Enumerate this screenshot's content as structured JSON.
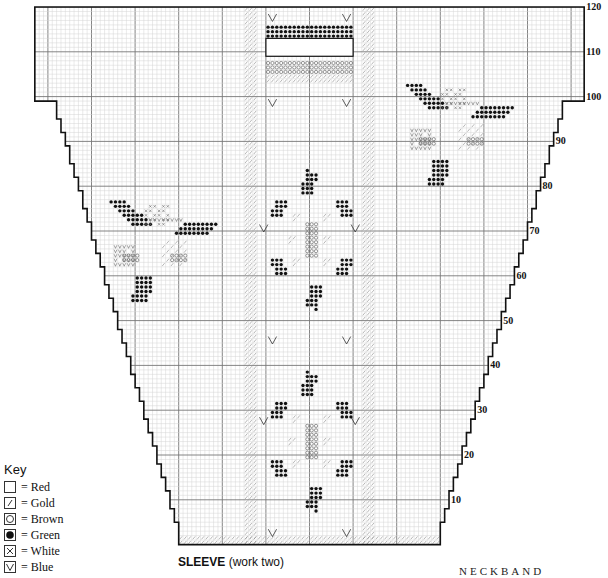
{
  "chart_data": {
    "type": "knitting-chart",
    "title": "SLEEVE",
    "subtitle": "(work two)",
    "secondary_label": "NECKBAND",
    "rows": 120,
    "row_labels": [
      "10",
      "20",
      "30",
      "40",
      "50",
      "60",
      "70",
      "80",
      "90",
      "100",
      "110",
      "120"
    ],
    "grid": {
      "minor_every": 1,
      "major_every": 10
    },
    "symbols": [
      {
        "symbol": "blank",
        "color_name": "Red"
      },
      {
        "symbol": "slash",
        "color_name": "Gold"
      },
      {
        "symbol": "circle",
        "color_name": "Brown"
      },
      {
        "symbol": "dot",
        "color_name": "Green"
      },
      {
        "symbol": "cross",
        "color_name": "White"
      },
      {
        "symbol": "v",
        "color_name": "Blue"
      }
    ],
    "motifs": [
      {
        "name": "flower-left",
        "type": "rose",
        "colors": [
          "Green",
          "White",
          "Blue",
          "Brown",
          "Gold"
        ]
      },
      {
        "name": "flower-right",
        "type": "rose",
        "colors": [
          "Green",
          "White",
          "Blue",
          "Brown",
          "Gold"
        ]
      },
      {
        "name": "star-flower-upper",
        "type": "star-flower",
        "colors": [
          "Green",
          "Gold",
          "Brown"
        ]
      },
      {
        "name": "star-flower-lower",
        "type": "star-flower",
        "colors": [
          "Green",
          "Gold",
          "Brown"
        ]
      },
      {
        "name": "top-band",
        "rows": [
          104,
          116
        ],
        "colors": [
          "Green",
          "Red",
          "Brown",
          "Gold"
        ]
      },
      {
        "name": "gold-stripes",
        "type": "vertical stripes",
        "colors": [
          "Gold"
        ]
      },
      {
        "name": "cuff",
        "rows": [
          1,
          2
        ],
        "colors": [
          "Gold"
        ]
      }
    ]
  },
  "key": {
    "title": "Key",
    "items": [
      {
        "symbol": "blank",
        "label": "= Red"
      },
      {
        "symbol": "slash",
        "label": "= Gold"
      },
      {
        "symbol": "circle",
        "label": "= Brown"
      },
      {
        "symbol": "dot",
        "label": "= Green"
      },
      {
        "symbol": "cross",
        "label": "= White"
      },
      {
        "symbol": "v",
        "label": "= Blue"
      }
    ]
  },
  "caption": {
    "title": "SLEEVE",
    "note": " (work two)"
  },
  "neckband_label": "NECKBAND"
}
